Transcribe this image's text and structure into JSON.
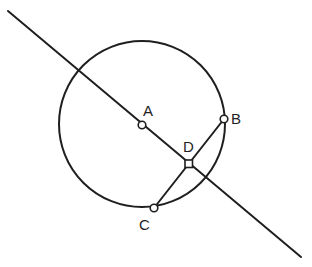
{
  "diagram": {
    "type": "geometry-construction",
    "colors": {
      "ink": "#1f1f1f",
      "background": "#ffffff"
    },
    "points": [
      {
        "id": "A",
        "label": "A",
        "role": "circle-center",
        "marker": "circle"
      },
      {
        "id": "B",
        "label": "B",
        "role": "point-on-circle",
        "marker": "circle"
      },
      {
        "id": "C",
        "label": "C",
        "role": "point-on-circle",
        "marker": "circle"
      },
      {
        "id": "D",
        "label": "D",
        "role": "intersection-of-line-and-chord",
        "marker": "square"
      }
    ],
    "segments": [
      {
        "id": "BC",
        "from": "B",
        "to": "C",
        "role": "chord"
      }
    ],
    "lines": [
      {
        "id": "line-AD",
        "through": [
          "A",
          "D"
        ],
        "role": "line-through-center"
      }
    ],
    "circles": [
      {
        "id": "circle-A",
        "center": "A",
        "through": [
          "B",
          "C"
        ]
      }
    ]
  }
}
